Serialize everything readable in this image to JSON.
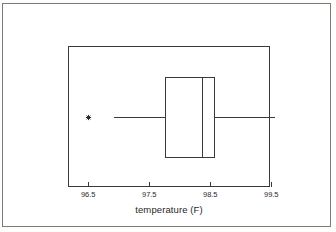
{
  "figure": {
    "kind": "boxplot-figure",
    "background_color": "#ffffff",
    "border_color": "#7a7a78",
    "ink_color": "#3a3a3a"
  },
  "axis": {
    "x_title": "temperature (F)",
    "tick_labels": [
      "96.5",
      "97.5",
      "98.5",
      "99.5"
    ],
    "tick_values": [
      96.5,
      97.5,
      98.5,
      99.5
    ]
  },
  "chart_data": {
    "type": "box",
    "title": "",
    "xlabel": "temperature (F)",
    "ylabel": "",
    "orientation": "horizontal",
    "xlim": [
      96.17,
      99.48
    ],
    "ylim": [
      0,
      1
    ],
    "grid": false,
    "legend": null,
    "legend_position": "none",
    "xticks": [
      96.5,
      97.5,
      98.5,
      99.5
    ],
    "xticklabels": [
      "96.5",
      "97.5",
      "98.5",
      "99.5"
    ],
    "boxes": [
      {
        "name": "temperature",
        "whisker_low": 96.91,
        "q1": 97.76,
        "median": 98.37,
        "q3": 98.56,
        "whisker_high": 99.55,
        "outliers": [
          96.5
        ],
        "outlier_marker": "asterisk",
        "fill": "none",
        "edge_color": "#3a3a3a"
      }
    ]
  }
}
